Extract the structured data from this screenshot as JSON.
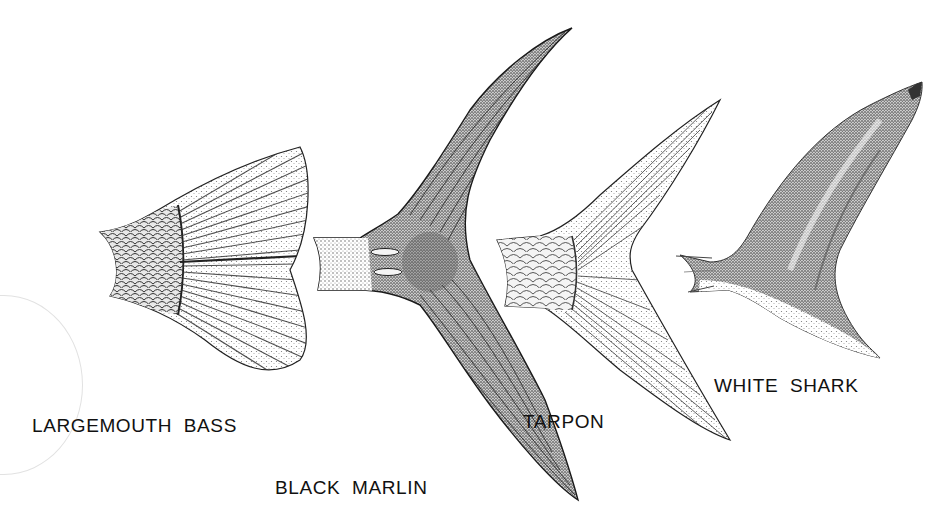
{
  "figure": {
    "background_color": "#ffffff",
    "ink_color": "#111111",
    "fins": [
      {
        "id": "largemouth-bass",
        "label": "LARGEMOUTH  BASS",
        "shape": "truncate / slightly rounded, scaled peduncle, radiating rays"
      },
      {
        "id": "black-marlin",
        "label": "BLACK  MARLIN",
        "shape": "lunate, long sickle-shaped lobes, keeled peduncle"
      },
      {
        "id": "tarpon",
        "label": "TARPON",
        "shape": "deeply forked, large scales on peduncle, fine rays"
      },
      {
        "id": "white-shark",
        "label": "WHITE  SHARK",
        "shape": "heterocercal-looking lunate, upper lobe with notched tip"
      }
    ]
  }
}
